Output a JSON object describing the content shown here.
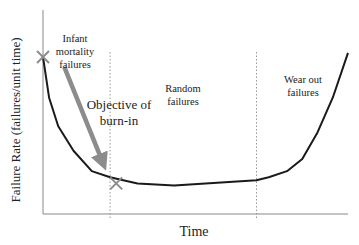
{
  "chart_data": {
    "type": "line",
    "title": "",
    "xlabel": "Time",
    "ylabel": "Failure Rate (failures/unit time)",
    "xlim": [
      0,
      100
    ],
    "ylim": [
      0,
      100
    ],
    "grid": false,
    "legend": "none",
    "series": [
      {
        "name": "Failure rate (bathtub curve)",
        "color": "#1a1a1a",
        "x": [
          0,
          2,
          5,
          10,
          16,
          22,
          31,
          43,
          70,
          74,
          80,
          85,
          90,
          95,
          100
        ],
        "y": [
          77,
          57,
          43,
          31,
          21,
          18,
          15,
          14,
          16.5,
          18,
          21,
          27,
          40,
          57,
          79
        ]
      }
    ],
    "phase_dividers": [
      22,
      70
    ],
    "regions": [
      {
        "label": "Infant mortality failures",
        "lines": [
          "Infant",
          "mortality",
          "failures"
        ]
      },
      {
        "label": "Random failures",
        "lines": [
          "Random",
          "failures"
        ]
      },
      {
        "label": "Wear out failures",
        "lines": [
          "Wear out",
          "failures"
        ]
      }
    ],
    "annotations": [
      {
        "text": "Objective of burn-in",
        "lines": [
          "Objective of",
          "burn-in"
        ],
        "type": "arrow",
        "from": [
          7,
          72
        ],
        "to": [
          21,
          22
        ],
        "color": "#8c8c8c"
      }
    ],
    "markers": [
      {
        "name": "burn-in-start",
        "symbol": "x",
        "x": 0,
        "y": 77,
        "color": "#8c8c8c"
      },
      {
        "name": "burn-in-end",
        "symbol": "x",
        "x": 24,
        "y": 15,
        "color": "#8c8c8c"
      }
    ]
  }
}
